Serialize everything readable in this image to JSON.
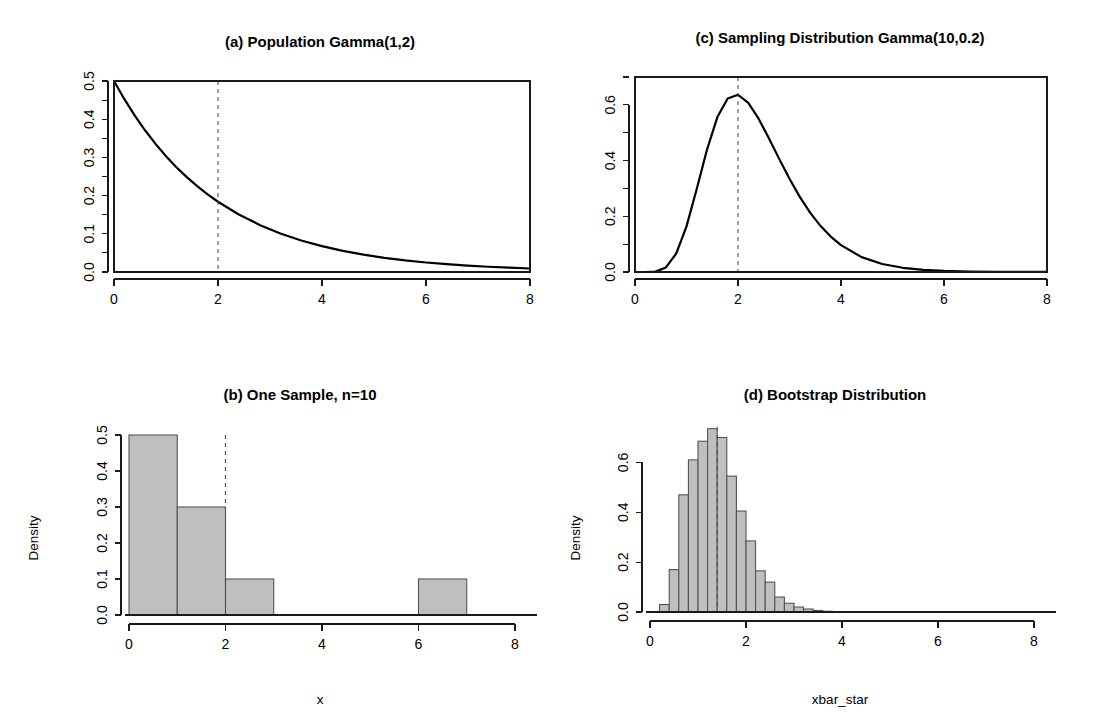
{
  "figure": {
    "background_color": "#ffffff",
    "bar_fill_color": "#bfbfbf",
    "bar_border_color": "#4f4f4f",
    "curve_color": "#000000",
    "reference_line_color": "#4d4d4d"
  },
  "panels": {
    "a": {
      "title": "(a) Population Gamma(1,2)",
      "xlabel": "",
      "ylabel": "",
      "x_ticks": [
        "0",
        "2",
        "4",
        "6",
        "8"
      ],
      "y_ticks": [
        "0.0",
        "0.1",
        "0.2",
        "0.3",
        "0.4",
        "0.5"
      ]
    },
    "b": {
      "title": "(b) One Sample, n=10",
      "xlabel": "x",
      "ylabel": "Density",
      "x_ticks": [
        "0",
        "2",
        "4",
        "6",
        "8"
      ],
      "y_ticks": [
        "0.0",
        "0.1",
        "0.2",
        "0.3",
        "0.4",
        "0.5"
      ]
    },
    "c": {
      "title": "(c) Sampling Distribution Gamma(10,0.2)",
      "xlabel": "",
      "ylabel": "",
      "x_ticks": [
        "0",
        "2",
        "4",
        "6",
        "8"
      ],
      "y_ticks": [
        "0.0",
        "0.2",
        "0.4",
        "0.6"
      ]
    },
    "d": {
      "title": "(d) Bootstrap Distribution",
      "xlabel": "xbar_star",
      "ylabel": "Density",
      "x_ticks": [
        "0",
        "2",
        "4",
        "6",
        "8"
      ],
      "y_ticks": [
        "0.0",
        "0.2",
        "0.4",
        "0.6"
      ]
    }
  },
  "chart_data": [
    {
      "id": "a",
      "type": "line",
      "title": "(a) Population Gamma(1,2)",
      "xlabel": "",
      "ylabel": "",
      "xlim": [
        0,
        8
      ],
      "ylim": [
        0,
        0.5
      ],
      "xticks": [
        0,
        2,
        4,
        6,
        8
      ],
      "yticks": [
        0.0,
        0.1,
        0.2,
        0.3,
        0.4,
        0.5
      ],
      "grid": false,
      "legend": "none",
      "distribution": "Gamma(shape=1, scale=2) density f(x)=0.5*exp(-x/2)",
      "annotations": [
        {
          "type": "vline",
          "x": 2,
          "style": "dashed",
          "label": "population mean = 2"
        }
      ],
      "x": [
        0,
        0.2,
        0.4,
        0.6,
        0.8,
        1.0,
        1.2,
        1.4,
        1.6,
        1.8,
        2.0,
        2.4,
        2.8,
        3.2,
        3.6,
        4.0,
        4.4,
        4.8,
        5.2,
        5.6,
        6.0,
        6.4,
        6.8,
        7.2,
        7.6,
        8.0
      ],
      "y": [
        0.5,
        0.4524,
        0.4094,
        0.3704,
        0.3352,
        0.3033,
        0.2744,
        0.2483,
        0.2247,
        0.2033,
        0.1839,
        0.1506,
        0.1233,
        0.1009,
        0.0826,
        0.0677,
        0.0554,
        0.0454,
        0.0372,
        0.0304,
        0.0249,
        0.0204,
        0.0167,
        0.0137,
        0.0112,
        0.0092
      ]
    },
    {
      "id": "b",
      "type": "bar",
      "title": "(b) One Sample, n=10",
      "xlabel": "x",
      "ylabel": "Density",
      "xlim": [
        0,
        8
      ],
      "ylim": [
        0,
        0.5
      ],
      "xticks": [
        0,
        2,
        4,
        6,
        8
      ],
      "yticks": [
        0.0,
        0.1,
        0.2,
        0.3,
        0.4,
        0.5
      ],
      "grid": false,
      "legend": "none",
      "bin_edges": [
        0,
        1,
        2,
        3,
        4,
        5,
        6,
        7
      ],
      "densities": [
        0.5,
        0.3,
        0.1,
        0.0,
        0.0,
        0.0,
        0.1
      ],
      "annotations": [
        {
          "type": "vline",
          "x": 2,
          "style": "dashed",
          "label": "population mean = 2"
        }
      ]
    },
    {
      "id": "c",
      "type": "line",
      "title": "(c) Sampling Distribution Gamma(10,0.2)",
      "xlabel": "",
      "ylabel": "",
      "xlim": [
        0,
        8
      ],
      "ylim": [
        0,
        0.7
      ],
      "xticks": [
        0,
        2,
        4,
        6,
        8
      ],
      "yticks": [
        0.0,
        0.2,
        0.4,
        0.6
      ],
      "grid": false,
      "legend": "none",
      "distribution": "Gamma(shape=10, scale=0.2) density of sample mean",
      "annotations": [
        {
          "type": "vline",
          "x": 2,
          "style": "dashed",
          "label": "population mean = 2"
        }
      ],
      "x": [
        0,
        0.2,
        0.4,
        0.6,
        0.8,
        1.0,
        1.2,
        1.4,
        1.6,
        1.8,
        2.0,
        2.2,
        2.4,
        2.6,
        2.8,
        3.0,
        3.2,
        3.4,
        3.6,
        3.8,
        4.0,
        4.4,
        4.8,
        5.2,
        5.6,
        6.0,
        6.5,
        7.0,
        7.5,
        8.0
      ],
      "y": [
        0.0,
        0.0,
        0.0014,
        0.0163,
        0.0661,
        0.1637,
        0.2986,
        0.4404,
        0.5561,
        0.6231,
        0.6363,
        0.6069,
        0.5503,
        0.4801,
        0.4061,
        0.3347,
        0.2696,
        0.2131,
        0.1657,
        0.1271,
        0.0963,
        0.0534,
        0.0287,
        0.0151,
        0.0078,
        0.0039,
        0.0016,
        0.0006,
        0.0002,
        0.0001
      ]
    },
    {
      "id": "d",
      "type": "bar",
      "title": "(d) Bootstrap Distribution",
      "xlabel": "xbar_star",
      "ylabel": "Density",
      "xlim": [
        0,
        8
      ],
      "ylim": [
        0,
        0.75
      ],
      "xticks": [
        0,
        2,
        4,
        6,
        8
      ],
      "yticks": [
        0.0,
        0.2,
        0.4,
        0.6
      ],
      "grid": false,
      "legend": "none",
      "bin_width": 0.2,
      "bin_edges": [
        0.2,
        0.4,
        0.6,
        0.8,
        1.0,
        1.2,
        1.4,
        1.6,
        1.8,
        2.0,
        2.2,
        2.4,
        2.6,
        2.8,
        3.0,
        3.2,
        3.4,
        3.6,
        3.8
      ],
      "densities": [
        0.03,
        0.17,
        0.47,
        0.61,
        0.685,
        0.735,
        0.7,
        0.545,
        0.405,
        0.285,
        0.165,
        0.12,
        0.06,
        0.035,
        0.02,
        0.012,
        0.006,
        0.003
      ],
      "annotations": [
        {
          "type": "vline",
          "x": 1.4,
          "style": "dashed",
          "label": "sample mean"
        }
      ]
    }
  ]
}
